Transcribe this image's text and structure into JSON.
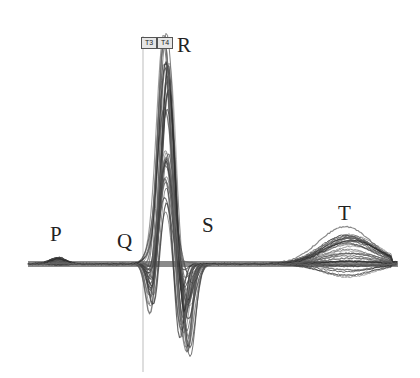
{
  "figure": {
    "background": "#ffffff",
    "trace_color": "#2a2a2a",
    "baseline_y": 264
  },
  "wave_labels": [
    {
      "id": "P",
      "text": "P",
      "x": 50,
      "y": 241
    },
    {
      "id": "Q",
      "text": "Q",
      "x": 117,
      "y": 248
    },
    {
      "id": "R",
      "text": "R",
      "x": 177,
      "y": 52
    },
    {
      "id": "S",
      "text": "S",
      "x": 202,
      "y": 232
    },
    {
      "id": "T",
      "text": "T",
      "x": 338,
      "y": 220
    }
  ],
  "markers": [
    {
      "label": "T3",
      "x": 141
    },
    {
      "label": "T4",
      "x": 157
    }
  ],
  "cursor_line": {
    "x": 143
  }
}
